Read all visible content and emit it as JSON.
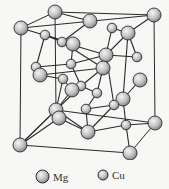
{
  "colors": {
    "background": "#f7f7f5",
    "bond": "#2a2a2a",
    "atom_fill_light": "#f0f0f0",
    "atom_fill_dark": "#8a8a8a",
    "atom_stroke": "#2b2b2b"
  },
  "legend": {
    "items": [
      {
        "label": "Mg",
        "radius": 7,
        "cx": 42
      },
      {
        "label": "Cu",
        "radius": 5,
        "cx": 103
      }
    ]
  },
  "cell_edges": [
    [
      21,
      28,
      154,
      15
    ],
    [
      154,
      15,
      155,
      123
    ],
    [
      155,
      123,
      130,
      153
    ],
    [
      130,
      153,
      20,
      145
    ],
    [
      20,
      145,
      21,
      28
    ],
    [
      55,
      12,
      154,
      15
    ],
    [
      21,
      28,
      55,
      12
    ],
    [
      55,
      12,
      56,
      110
    ],
    [
      56,
      110,
      155,
      123
    ],
    [
      56,
      110,
      20,
      145
    ]
  ],
  "bonds": [
    [
      55,
      12,
      90,
      21
    ],
    [
      21,
      28,
      73,
      44
    ],
    [
      45,
      35,
      73,
      44
    ],
    [
      45,
      35,
      62,
      42
    ],
    [
      62,
      42,
      106,
      55
    ],
    [
      112,
      28,
      128,
      33
    ],
    [
      128,
      33,
      154,
      15
    ],
    [
      128,
      33,
      106,
      55
    ],
    [
      128,
      33,
      137,
      57
    ],
    [
      106,
      55,
      137,
      57
    ],
    [
      45,
      35,
      36,
      67
    ],
    [
      36,
      67,
      71,
      64
    ],
    [
      71,
      64,
      106,
      55
    ],
    [
      73,
      44,
      71,
      64
    ],
    [
      62,
      42,
      103,
      68
    ],
    [
      106,
      55,
      103,
      68
    ],
    [
      103,
      68,
      40,
      75
    ],
    [
      40,
      75,
      63,
      79
    ],
    [
      63,
      79,
      72,
      90
    ],
    [
      71,
      64,
      81,
      86
    ],
    [
      81,
      86,
      103,
      68
    ],
    [
      103,
      68,
      97,
      93
    ],
    [
      97,
      93,
      81,
      86
    ],
    [
      106,
      55,
      114,
      105
    ],
    [
      128,
      33,
      123,
      99
    ],
    [
      123,
      99,
      114,
      105
    ],
    [
      114,
      105,
      86,
      109
    ],
    [
      86,
      109,
      97,
      93
    ],
    [
      72,
      90,
      56,
      110
    ],
    [
      81,
      86,
      56,
      110
    ],
    [
      56,
      110,
      88,
      132
    ],
    [
      86,
      109,
      88,
      132
    ],
    [
      114,
      105,
      88,
      132
    ],
    [
      123,
      99,
      126,
      125
    ],
    [
      126,
      125,
      88,
      132
    ],
    [
      126,
      125,
      155,
      123
    ],
    [
      126,
      125,
      130,
      153
    ],
    [
      59,
      118,
      20,
      145
    ],
    [
      56,
      110,
      20,
      145
    ],
    [
      88,
      132,
      59,
      118
    ],
    [
      140,
      80,
      123,
      99
    ],
    [
      73,
      44,
      45,
      35
    ],
    [
      36,
      67,
      40,
      75
    ],
    [
      63,
      79,
      56,
      110
    ],
    [
      112,
      28,
      106,
      55
    ],
    [
      90,
      21,
      62,
      42
    ]
  ],
  "atoms": {
    "Mg": [
      [
        55,
        12
      ],
      [
        21,
        28
      ],
      [
        154,
        15
      ],
      [
        90,
        21
      ],
      [
        128,
        33
      ],
      [
        73,
        44
      ],
      [
        106,
        55
      ],
      [
        103,
        68
      ],
      [
        40,
        75
      ],
      [
        140,
        80
      ],
      [
        72,
        90
      ],
      [
        123,
        99
      ],
      [
        56,
        110
      ],
      [
        59,
        118
      ],
      [
        88,
        132
      ],
      [
        155,
        123
      ],
      [
        20,
        145
      ],
      [
        130,
        153
      ]
    ],
    "Cu": [
      [
        45,
        35
      ],
      [
        62,
        42
      ],
      [
        112,
        28
      ],
      [
        137,
        57
      ],
      [
        71,
        64
      ],
      [
        36,
        67
      ],
      [
        63,
        79
      ],
      [
        81,
        86
      ],
      [
        97,
        93
      ],
      [
        114,
        105
      ],
      [
        86,
        109
      ],
      [
        126,
        125
      ]
    ]
  }
}
